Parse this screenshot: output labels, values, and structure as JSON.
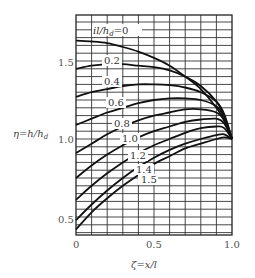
{
  "chart_data": {
    "type": "line",
    "title": "",
    "xlabel": "ζ = x/l",
    "ylabel": "η = h/h_d",
    "xlim": [
      0,
      1.0
    ],
    "ylim": [
      0.375,
      1.8
    ],
    "grid": true,
    "x_ticks": [
      "0",
      "0.5",
      "1.0"
    ],
    "y_ticks": [
      "0.5",
      "1.0",
      "1.5"
    ],
    "legend_title": "il/h_d",
    "x": [
      0,
      0.1,
      0.2,
      0.3,
      0.4,
      0.5,
      0.6,
      0.7,
      0.8,
      0.9,
      0.95,
      1.0
    ],
    "series": [
      {
        "name": "0",
        "label": "il/h_d = 0",
        "values": [
          1.63,
          1.625,
          1.615,
          1.59,
          1.56,
          1.52,
          1.47,
          1.4,
          1.32,
          1.2,
          1.12,
          1.0
        ]
      },
      {
        "name": "0.2",
        "label": "0.2",
        "values": [
          1.45,
          1.47,
          1.48,
          1.48,
          1.47,
          1.46,
          1.44,
          1.4,
          1.34,
          1.24,
          1.15,
          1.0
        ]
      },
      {
        "name": "0.4",
        "label": "0.4",
        "values": [
          1.27,
          1.3,
          1.32,
          1.34,
          1.35,
          1.35,
          1.345,
          1.33,
          1.3,
          1.24,
          1.16,
          1.0
        ]
      },
      {
        "name": "0.6",
        "label": "0.6",
        "values": [
          1.09,
          1.13,
          1.17,
          1.2,
          1.23,
          1.25,
          1.26,
          1.26,
          1.25,
          1.21,
          1.14,
          1.0
        ]
      },
      {
        "name": "0.8",
        "label": "0.8",
        "values": [
          0.91,
          0.97,
          1.03,
          1.08,
          1.12,
          1.15,
          1.17,
          1.19,
          1.19,
          1.17,
          1.12,
          1.0
        ]
      },
      {
        "name": "1.0",
        "label": "1.0",
        "values": [
          0.75,
          0.83,
          0.9,
          0.96,
          1.01,
          1.05,
          1.08,
          1.11,
          1.125,
          1.13,
          1.1,
          1.0
        ]
      },
      {
        "name": "1.2",
        "label": "1.2",
        "values": [
          0.61,
          0.7,
          0.78,
          0.85,
          0.91,
          0.96,
          1.0,
          1.04,
          1.07,
          1.08,
          1.07,
          1.0
        ]
      },
      {
        "name": "1.4",
        "label": "1.4",
        "values": [
          0.48,
          0.58,
          0.67,
          0.75,
          0.82,
          0.88,
          0.93,
          0.97,
          1.0,
          1.025,
          1.03,
          1.0
        ]
      },
      {
        "name": "1.5",
        "label": "1.5",
        "values": [
          0.42,
          0.53,
          0.62,
          0.7,
          0.77,
          0.84,
          0.89,
          0.94,
          0.97,
          1.0,
          1.01,
          1.0
        ]
      }
    ]
  },
  "labels": {
    "x_axis": "ζ=x/l",
    "y_axis": "η=h/h",
    "y_axis_sub": "d",
    "curve_title_prefix": "il/h",
    "curve_title_sub": "d",
    "curve_title_suffix": "=0",
    "tick_x0": "0",
    "tick_x05": "0.5",
    "tick_x10": "1.0",
    "tick_y05": "0.5",
    "tick_y10": "1.0",
    "tick_y15": "1.5",
    "curve_02": "0.2",
    "curve_04": "0.4",
    "curve_06": "0.6",
    "curve_08": "0.8",
    "curve_10": "1.0",
    "curve_12": "1.2",
    "curve_14": "1.4",
    "curve_15": "1.5"
  }
}
